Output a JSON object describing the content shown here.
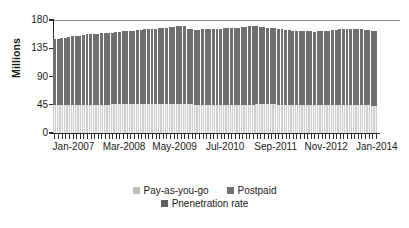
{
  "chart_data": {
    "type": "bar",
    "stacked": true,
    "title": "",
    "subtitle": "",
    "xlabel": "",
    "ylabel": "Millions",
    "ylim": [
      0,
      180
    ],
    "yticks": [
      0,
      45,
      90,
      135,
      180
    ],
    "ytick_labels": [
      "0",
      "45",
      "90",
      "135",
      "180"
    ],
    "grid": "top-only",
    "legend_position": "bottom-center",
    "x_axis_tick_labels": [
      "Jan-2007",
      "Mar-2008",
      "May-2009",
      "Jul-2010",
      "Sep-2011",
      "Nov-2012",
      "Jan-2014"
    ],
    "x_axis_tick_indices": [
      0,
      14,
      28,
      42,
      56,
      70,
      84
    ],
    "x_axis_unit": "month",
    "x_axis_start": "Jan-2007",
    "x_axis_end": "Jul-2014",
    "series": [
      {
        "name": "Pay-as-you-go",
        "color": "#f2f2f2",
        "values": [
          45,
          45,
          45,
          45,
          45,
          45,
          45,
          45,
          45,
          45,
          45,
          45,
          45,
          45,
          45,
          45,
          46,
          46,
          46,
          46,
          46,
          46,
          46,
          46,
          46,
          46,
          46,
          46,
          46,
          46,
          46,
          46,
          46,
          46,
          46,
          46,
          46,
          46,
          46,
          45,
          45,
          45,
          45,
          45,
          45,
          45,
          45,
          45,
          45,
          45,
          45,
          45,
          45,
          45,
          45,
          45,
          46,
          46,
          46,
          46,
          46,
          46,
          45,
          45,
          45,
          45,
          45,
          45,
          45,
          45,
          45,
          45,
          44,
          44,
          44,
          44,
          44,
          44,
          44,
          44,
          44,
          44,
          44,
          44,
          44,
          44,
          44,
          44,
          43,
          43
        ]
      },
      {
        "name": "Postpaid",
        "color": "#6f6f6f",
        "values": [
          104,
          105,
          106,
          107,
          108,
          109,
          110,
          110,
          111,
          112,
          112,
          113,
          113,
          114,
          114,
          115,
          114,
          115,
          115,
          116,
          116,
          117,
          117,
          118,
          118,
          119,
          119,
          120,
          120,
          121,
          121,
          122,
          123,
          123,
          124,
          124,
          125,
          120,
          119,
          119,
          119,
          120,
          120,
          120,
          121,
          121,
          121,
          122,
          122,
          122,
          123,
          123,
          124,
          124,
          125,
          125,
          124,
          123,
          123,
          122,
          122,
          121,
          121,
          120,
          119,
          119,
          118,
          118,
          117,
          117,
          117,
          117,
          117,
          118,
          118,
          119,
          119,
          120,
          120,
          121,
          121,
          121,
          121,
          121,
          121,
          121,
          120,
          120,
          120,
          120
        ]
      },
      {
        "name": "Pnenetration rate",
        "color": "#5f5f5f",
        "values": []
      }
    ],
    "totals_note": "stacked totals range approx. 149 to 165 millions",
    "legend_entries": [
      {
        "label": "Pay-as-you-go",
        "color": "#bfbfbf"
      },
      {
        "label": "Postpaid",
        "color": "#6f6f6f"
      },
      {
        "label": "Pnenetration rate",
        "color": "#5f5f5f"
      }
    ]
  }
}
